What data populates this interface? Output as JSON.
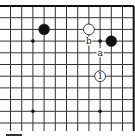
{
  "diagram": {
    "type": "go-board-fragment",
    "columns": 12,
    "rows": 12,
    "edges": [
      "top",
      "right"
    ],
    "star_points": [
      {
        "col": 2,
        "row": 3
      },
      {
        "col": 8,
        "row": 3
      },
      {
        "col": 2,
        "row": 9
      },
      {
        "col": 8,
        "row": 9
      }
    ],
    "stones": [
      {
        "color": "black",
        "col": 3,
        "row": 2,
        "label": ""
      },
      {
        "color": "white",
        "col": 7,
        "row": 2,
        "label": ""
      },
      {
        "color": "black",
        "col": 9,
        "row": 3,
        "label": ""
      },
      {
        "color": "white",
        "col": 8,
        "row": 6,
        "label": "1"
      }
    ],
    "markers": [
      {
        "text": "b",
        "col": 7,
        "row": 3
      },
      {
        "text": "a",
        "col": 8,
        "row": 4
      }
    ],
    "colors": {
      "line": "#333333",
      "edge": "#111111",
      "black_stone": "#111111",
      "white_stone": "#ffffff",
      "background": "#ffffff"
    }
  }
}
